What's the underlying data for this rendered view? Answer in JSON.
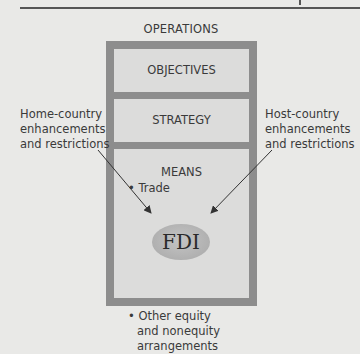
{
  "diagram": {
    "title": "OPERATIONS",
    "panels": [
      {
        "label": "OBJECTIVES"
      },
      {
        "label": "STRATEGY"
      },
      {
        "label": "MEANS"
      }
    ],
    "means_items": {
      "item1": "• Trade",
      "center": "FDI",
      "item2_lines": [
        "• Other equity",
        "and nonequity",
        "arrangements"
      ]
    },
    "left_label_lines": [
      "Home-country",
      "enhancements",
      "and restrictions"
    ],
    "right_label_lines": [
      "Host-country",
      "enhancements",
      "and restrictions"
    ],
    "colors": {
      "background": "#e9e9e7",
      "outer_frame": "#8d8d8d",
      "panel": "#dcdcdb",
      "ellipse": "#b5b5b5"
    }
  }
}
